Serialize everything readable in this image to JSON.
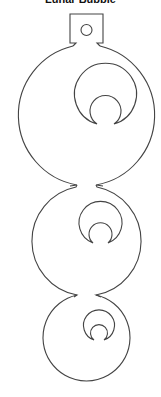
{
  "title": "Lunar Bubble",
  "diagram": {
    "type": "ornament-template",
    "stroke_color": "#444444",
    "background": "#ffffff",
    "hanger_tab": {
      "x": 70,
      "y": 14,
      "width": 33,
      "height": 30,
      "hole": {
        "cx": 86,
        "cy": 30,
        "r": 5
      }
    },
    "bubbles": [
      {
        "cx": 86,
        "cy": 115,
        "r": 71,
        "moon": {
          "outer": {
            "cx": 105,
            "cy": 94,
            "r": 31
          },
          "inner": {
            "cx": 105.5,
            "cy": 109,
            "r": 15.5
          }
        }
      },
      {
        "cx": 87.5,
        "cy": 240,
        "r": 55,
        "moon": {
          "outer": {
            "cx": 100.5,
            "cy": 222,
            "r": 21.5
          },
          "inner": {
            "cx": 100.5,
            "cy": 234,
            "r": 11.5
          }
        }
      },
      {
        "cx": 87.5,
        "cy": 339,
        "r": 43.5,
        "moon": {
          "outer": {
            "cx": 98.5,
            "cy": 325,
            "r": 15.5
          },
          "inner": {
            "cx": 99.5,
            "cy": 332,
            "r": 8.5
          }
        }
      }
    ]
  }
}
